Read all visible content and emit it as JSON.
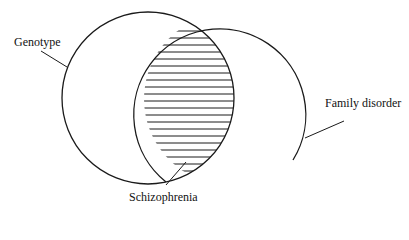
{
  "diagram": {
    "type": "venn",
    "sets": [
      {
        "name": "Genotype"
      },
      {
        "name": "Family disorder"
      }
    ],
    "intersection": {
      "name": "Schizophrenia",
      "fill": "horizontal-hatch"
    }
  },
  "labels": {
    "left": "Genotype",
    "right": "Family disorder",
    "intersection": "Schizophrenia"
  },
  "colors": {
    "stroke": "#1a1a1a",
    "background": "#ffffff"
  }
}
